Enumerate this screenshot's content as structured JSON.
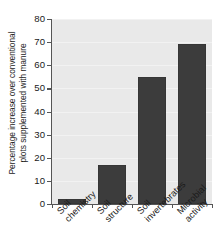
{
  "chart_data": {
    "type": "bar",
    "title": "",
    "subtitle": "",
    "xlabel": "",
    "ylabel": "Percentage increase over conventional plots supplemented with manure",
    "ylabel_lines": [
      "Percentage increase over conventional",
      "plots supplemented with manure"
    ],
    "categories": [
      "Soil chemistry",
      "Soil structure",
      "Soil invertebrates",
      "Microbial activity"
    ],
    "category_lines": [
      [
        "Soil",
        "chemistry"
      ],
      [
        "Soil",
        "structure"
      ],
      [
        "Soil",
        "invertebrates"
      ],
      [
        "Microbial",
        "activity"
      ]
    ],
    "values": [
      2,
      17,
      55,
      69
    ],
    "ylim": [
      0,
      80
    ],
    "ytick_values": [
      0,
      10,
      20,
      30,
      40,
      50,
      60,
      70,
      80
    ],
    "ytick_labels": [
      "0",
      "10",
      "20",
      "30",
      "40",
      "50",
      "60",
      "70",
      "80"
    ],
    "grid": true,
    "legend": false,
    "legend_position": "none",
    "bar_color": "#3c3c3c",
    "plot_background": "#e9e9e9",
    "page_background": "#ffffff",
    "axis_color": "#555555",
    "text_color": "#1a1a1a"
  }
}
